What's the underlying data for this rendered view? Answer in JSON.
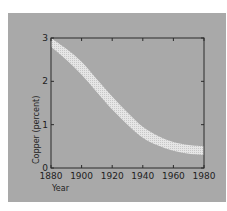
{
  "chart_data": {
    "type": "area",
    "title": "",
    "xlabel": "Year",
    "ylabel": "Copper (percent)",
    "xlim": [
      1880,
      1980
    ],
    "ylim": [
      0,
      3
    ],
    "x_ticks": [
      "1880",
      "1900",
      "1920",
      "1940",
      "1960",
      "1980"
    ],
    "y_ticks": [
      "0",
      "1",
      "2",
      "3"
    ],
    "grid": false,
    "legend": null,
    "x": [
      1880,
      1890,
      1900,
      1910,
      1920,
      1930,
      1940,
      1950,
      1960,
      1970,
      1980
    ],
    "series": [
      {
        "name": "upper bound",
        "values": [
          3.0,
          2.75,
          2.45,
          2.05,
          1.65,
          1.28,
          0.95,
          0.74,
          0.6,
          0.53,
          0.5
        ]
      },
      {
        "name": "lower bound",
        "values": [
          2.8,
          2.5,
          2.15,
          1.75,
          1.35,
          1.0,
          0.7,
          0.52,
          0.4,
          0.33,
          0.3
        ]
      }
    ],
    "annotation": "Shaded band showing declining copper ore grade (percent) over time"
  },
  "colors": {
    "background": "#a9a9a9",
    "band": "#e6e6e6",
    "axis": "#2a2a2a"
  }
}
